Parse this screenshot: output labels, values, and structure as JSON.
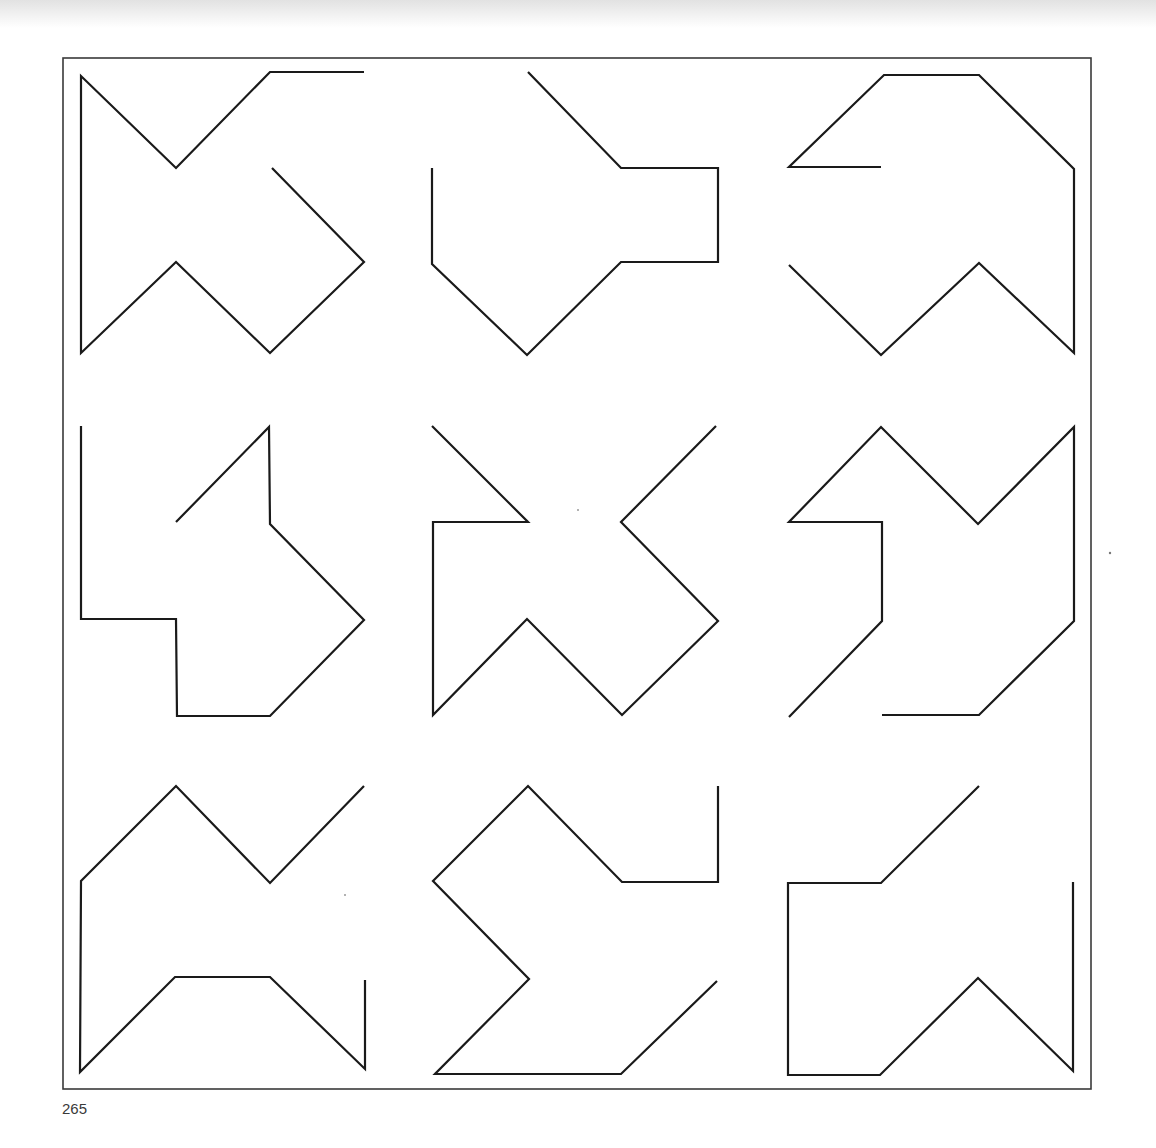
{
  "page": {
    "number": "265"
  },
  "style": {
    "stroke": "#1a1a1a",
    "stroke_width": 2.2,
    "frame_stroke": "#3a3a3a",
    "frame_width": 1.6
  },
  "frame": {
    "x": 63,
    "y": 58,
    "width": 1028,
    "height": 1031
  },
  "shapes": [
    {
      "id": "shape-1",
      "points": "364,72 270,72 176,168 81,76 81,353 176,262 270,353 364,262 272,168"
    },
    {
      "id": "shape-2",
      "points": "528,72 621,168 718,168 718,262 621,262 527,355 432,264 432,168"
    },
    {
      "id": "shape-3",
      "points": "881,167 789,167 884,75 979,75 1074,169 1074,353 979,263 881,355 789,265"
    },
    {
      "id": "shape-4",
      "points": "81,426 81,619 176,619 177,716 270,716 364,620 270,524 269,427 176,522"
    },
    {
      "id": "shape-5",
      "points": "432,426 528,522 433,522 433,715 527,619 622,715 718,621 621,522 716,426"
    },
    {
      "id": "shape-6",
      "points": "789,717 882,621 882,522 789,522 881,427 978,524 1074,427 1074,621 979,715 882,715"
    },
    {
      "id": "shape-7",
      "points": "364,786 270,883 176,786 81,881 80,1072 175,977 270,977 365,1069 365,980"
    },
    {
      "id": "shape-8",
      "points": "718,786 718,882 622,882 528,786 433,881 529,979 435,1074 621,1074 717,981"
    },
    {
      "id": "shape-9",
      "points": "979,786 881,883 788,883 788,1075 880,1075 978,978 1073,1071 1073,882"
    }
  ]
}
